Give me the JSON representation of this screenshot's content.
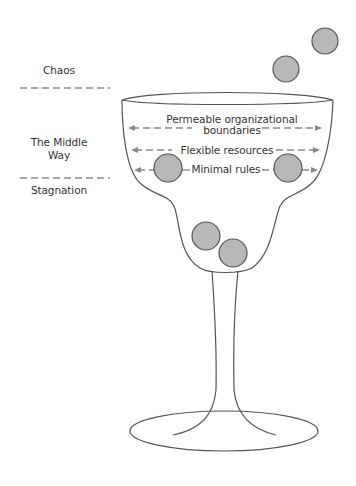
{
  "diagram": {
    "type": "metaphor-illustration",
    "side_labels": [
      {
        "id": "chaos",
        "text": "Chaos"
      },
      {
        "id": "middle",
        "line1": "The Middle",
        "line2": "Way"
      },
      {
        "id": "stagnation",
        "text": "Stagnation"
      }
    ],
    "bowl_labels": {
      "boundaries_line1": "Permeable organizational",
      "boundaries_line2": "boundaries",
      "resources": "Flexible resources",
      "rules": "Minimal rules"
    },
    "colors": {
      "line": "#555555",
      "ball_fill": "#b8b8b8",
      "ball_stroke": "#555555",
      "dash": "#888888",
      "text": "#333333"
    }
  }
}
